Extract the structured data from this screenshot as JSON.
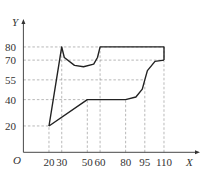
{
  "chart_data": {
    "type": "line",
    "title": "",
    "xlabel": "X",
    "ylabel": "Y",
    "origin_label": "O",
    "x_ticks": [
      20,
      30,
      50,
      60,
      80,
      95,
      110
    ],
    "y_ticks": [
      20,
      40,
      55,
      70,
      80
    ],
    "xlim": [
      0,
      120
    ],
    "ylim": [
      0,
      95
    ],
    "grid": "dashed guide lines at tick values",
    "series": [
      {
        "name": "upper boundary",
        "points": [
          [
            20,
            20
          ],
          [
            30,
            80
          ],
          [
            32,
            72
          ],
          [
            40,
            66
          ],
          [
            47,
            65
          ],
          [
            55,
            67
          ],
          [
            58,
            72
          ],
          [
            60,
            80
          ],
          [
            110,
            80
          ],
          [
            110,
            70
          ]
        ]
      },
      {
        "name": "lower boundary",
        "points": [
          [
            20,
            20
          ],
          [
            50,
            40
          ],
          [
            80,
            40
          ],
          [
            88,
            42
          ],
          [
            93,
            48
          ],
          [
            95,
            55
          ],
          [
            97,
            62
          ],
          [
            103,
            69
          ],
          [
            110,
            70
          ]
        ]
      }
    ],
    "colors": {
      "line": "#222222",
      "guide": "#888888",
      "axis": "#333333"
    }
  }
}
